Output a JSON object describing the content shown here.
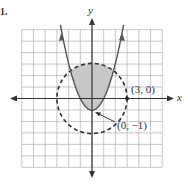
{
  "problem_number": "1.",
  "axes": {
    "x_label": "x",
    "y_label": "y",
    "range": [
      -6,
      6
    ]
  },
  "point_labels": {
    "circle_point": "(3, 0)",
    "vertex": "(0, −1)"
  },
  "graph": {
    "circle": {
      "center": [
        0,
        0
      ],
      "radius": 3,
      "style": "dashed"
    },
    "parabola": {
      "equation": "y = x^2 - 1",
      "vertex": [
        0,
        -1
      ],
      "style": "solid"
    },
    "shaded_region": "inside circle and above parabola",
    "colors": {
      "shade": "#c8c8c8",
      "ink": "#333333",
      "grid": "#b0b0b0"
    }
  }
}
